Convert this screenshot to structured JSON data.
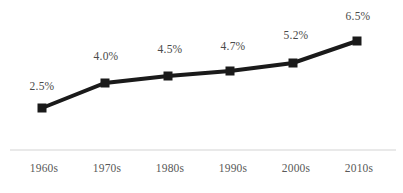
{
  "chart_data": {
    "type": "line",
    "title": "",
    "subtitle": "",
    "xlabel": "",
    "ylabel": "",
    "categories": [
      "1960s",
      "1970s",
      "1980s",
      "1990s",
      "2000s",
      "2010s"
    ],
    "values": [
      2.5,
      4.0,
      4.5,
      4.7,
      5.2,
      6.5
    ],
    "data_labels": [
      "2.5%",
      "4.0%",
      "4.5%",
      "4.7%",
      "5.2%",
      "6.5%"
    ],
    "ylim": [
      0,
      7
    ],
    "grid": false,
    "legend": false,
    "legend_position": "none",
    "series": [
      {
        "name": "",
        "values": [
          2.5,
          4.0,
          4.5,
          4.7,
          5.2,
          6.5
        ]
      }
    ],
    "style": {
      "line_color": "#1a1a1a",
      "marker_color": "#1a1a1a",
      "marker_shape": "square",
      "label_color": "#4a4a4a",
      "tick_color": "#595959",
      "axis_color": "#e2e2e2",
      "background": "#ffffff"
    },
    "points": [
      {
        "category": "1960s",
        "value": 2.5,
        "label": "2.5%",
        "x": 42,
        "y": 108,
        "label_x": 42,
        "label_y": 88
      },
      {
        "category": "1970s",
        "value": 4.0,
        "label": "4.0%",
        "x": 105,
        "y": 83,
        "label_x": 106,
        "label_y": 58
      },
      {
        "category": "1980s",
        "value": 4.5,
        "label": "4.5%",
        "x": 168,
        "y": 76,
        "label_x": 170,
        "label_y": 51
      },
      {
        "category": "1990s",
        "value": 4.7,
        "label": "4.7%",
        "x": 230,
        "y": 71,
        "label_x": 233,
        "label_y": 48
      },
      {
        "category": "2000s",
        "value": 5.2,
        "label": "5.2%",
        "x": 293,
        "y": 63,
        "label_x": 296,
        "label_y": 37
      },
      {
        "category": "2010s",
        "value": 6.5,
        "label": "6.5%",
        "x": 357,
        "y": 41,
        "label_x": 358,
        "label_y": 18
      }
    ],
    "axis": {
      "x_start": 10,
      "x_end": 396,
      "y": 150
    },
    "tick_positions": [
      44,
      107,
      170,
      233,
      296,
      359
    ],
    "tick_label_y": 170
  }
}
